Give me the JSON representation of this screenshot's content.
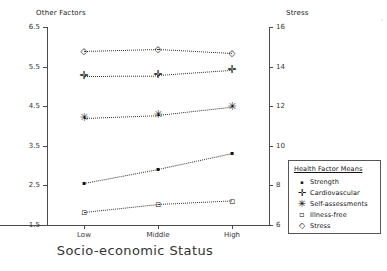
{
  "chart_data": {
    "type": "line",
    "title": "",
    "xlabel": "Socio-economic Status",
    "categories": [
      "Low",
      "Middle",
      "High"
    ],
    "left_axis": {
      "label": "Other Factors",
      "ylim": [
        1.5,
        6.5
      ],
      "ticks": [
        "1.5",
        "2.5",
        "3.5",
        "4.5",
        "5.5",
        "6.5"
      ]
    },
    "right_axis": {
      "label": "Stress",
      "ylim": [
        6,
        16
      ],
      "ticks": [
        "6",
        "8",
        "10",
        "12",
        "14",
        "16"
      ]
    },
    "grid": false,
    "legend_position": "right-outside",
    "legend_title": "Health Factor Means",
    "series": [
      {
        "name": "Strength",
        "symbol": "dot",
        "axis": "left",
        "values": [
          2.56,
          2.91,
          3.31
        ]
      },
      {
        "name": "Cardiovascular",
        "symbol": "plus",
        "axis": "left",
        "values": [
          5.27,
          5.28,
          5.41
        ]
      },
      {
        "name": "Self-assessments",
        "symbol": "asterisk",
        "axis": "left",
        "values": [
          4.21,
          4.28,
          4.49
        ]
      },
      {
        "name": "Illness-free",
        "symbol": "square",
        "axis": "left",
        "values": [
          1.82,
          2.02,
          2.11
        ]
      },
      {
        "name": "Stress",
        "symbol": "diamond",
        "axis": "right",
        "values": [
          14.8,
          14.9,
          14.7
        ]
      }
    ]
  },
  "figure": {
    "corner_mark": "·"
  }
}
